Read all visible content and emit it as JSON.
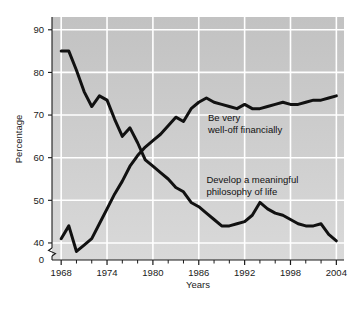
{
  "chart_data": {
    "type": "line",
    "title": "",
    "xlabel": "Years",
    "ylabel": "Percentage",
    "xlim": [
      1966.8,
      2005.0
    ],
    "ylim": [
      36,
      93
    ],
    "y_axis_break": true,
    "y_break_label": "0",
    "grid": true,
    "grid_color": "#ffffff",
    "plot_bg_top": "#c3c3c3",
    "plot_bg_bottom": "#d6d6d6",
    "line_color": "#111111",
    "yticks": [
      40,
      50,
      60,
      70,
      80,
      90
    ],
    "ytick_labels": [
      "40",
      "50",
      "60",
      "70",
      "80",
      "90"
    ],
    "xticks": [
      1968,
      1974,
      1980,
      1986,
      1992,
      1998,
      2004
    ],
    "xtick_labels": [
      "1968",
      "1974",
      "1980",
      "1986",
      "1992",
      "1998",
      "2004"
    ],
    "x_minor_tick_step": 2,
    "legend_position": "inline-annotation",
    "series": [
      {
        "name": "Be very well-off financially",
        "annotation_lines": [
          "Be very",
          "well-off financially"
        ],
        "annotation_x": 1987.2,
        "annotation_y": 68.5,
        "x": [
          1968,
          1969,
          1970,
          1971,
          1972,
          1973,
          1974,
          1975,
          1976,
          1977,
          1978,
          1979,
          1980,
          1981,
          1982,
          1983,
          1984,
          1985,
          1986,
          1987,
          1988,
          1989,
          1990,
          1991,
          1992,
          1993,
          1994,
          1995,
          1996,
          1997,
          1998,
          1999,
          2000,
          2001,
          2002,
          2003,
          2004
        ],
        "values": [
          41.0,
          44.0,
          38.0,
          39.5,
          41.0,
          44.5,
          48.0,
          51.5,
          54.5,
          58.0,
          60.5,
          62.5,
          64.0,
          65.5,
          67.5,
          69.5,
          68.5,
          71.5,
          73.0,
          74.0,
          73.0,
          72.5,
          72.0,
          71.5,
          72.5,
          71.5,
          71.5,
          72.0,
          72.5,
          73.0,
          72.5,
          72.5,
          73.0,
          73.5,
          73.5,
          74.0,
          74.5
        ]
      },
      {
        "name": "Develop a meaningful philosophy of life",
        "annotation_lines": [
          "Develop a meaningful",
          "philosophy of life"
        ],
        "annotation_x": 1987.0,
        "annotation_y": 54.0,
        "x": [
          1968,
          1969,
          1970,
          1971,
          1972,
          1973,
          1974,
          1975,
          1976,
          1977,
          1978,
          1979,
          1980,
          1981,
          1982,
          1983,
          1984,
          1985,
          1986,
          1987,
          1988,
          1989,
          1990,
          1991,
          1992,
          1993,
          1994,
          1995,
          1996,
          1997,
          1998,
          1999,
          2000,
          2001,
          2002,
          2003,
          2004
        ],
        "values": [
          85.0,
          85.0,
          80.5,
          75.5,
          72.0,
          74.5,
          73.5,
          69.0,
          65.0,
          67.0,
          63.5,
          59.5,
          58.0,
          56.5,
          55.0,
          53.0,
          52.0,
          49.5,
          48.5,
          47.0,
          45.5,
          44.0,
          44.0,
          44.5,
          45.0,
          46.5,
          49.5,
          48.0,
          47.0,
          46.5,
          45.5,
          44.5,
          44.0,
          44.0,
          44.5,
          42.0,
          40.5
        ]
      }
    ]
  }
}
